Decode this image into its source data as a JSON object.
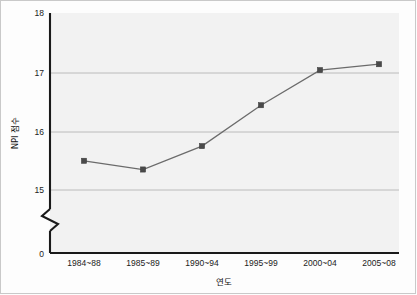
{
  "chart_data": {
    "type": "line",
    "title": "",
    "xlabel": "연도",
    "ylabel": "NPI 점수",
    "categories": [
      "1984~88",
      "1985~89",
      "1990~94",
      "1995~99",
      "2000~04",
      "2005~08"
    ],
    "values": [
      15.5,
      15.35,
      15.75,
      16.45,
      17.05,
      17.15
    ],
    "series": [
      {
        "name": "NPI 점수",
        "values": [
          15.5,
          15.35,
          15.75,
          16.45,
          17.05,
          17.15
        ]
      }
    ],
    "ylim": [
      15,
      18
    ],
    "y_ticks": [
      "15",
      "16",
      "17",
      "18"
    ],
    "y_origin_tick": "0",
    "axis_break": true,
    "grid": true,
    "legend": "none",
    "marker": "square",
    "line_color": "#6b6b6b",
    "marker_color": "#4a4a4a",
    "plot_background": "#f2f2f2",
    "figure_background": "#fdfdfd"
  },
  "axes": {
    "y_label": "NPI 점수",
    "x_label": "연도",
    "y_ticks": [
      {
        "label": "18",
        "value": 18
      },
      {
        "label": "17",
        "value": 17
      },
      {
        "label": "16",
        "value": 16
      },
      {
        "label": "15",
        "value": 15
      },
      {
        "label": "0",
        "value": 0
      }
    ],
    "x_ticks": [
      {
        "label": "1984~88"
      },
      {
        "label": "1985~89"
      },
      {
        "label": "1990~94"
      },
      {
        "label": "1995~99"
      },
      {
        "label": "2000~04"
      },
      {
        "label": "2005~08"
      }
    ]
  }
}
